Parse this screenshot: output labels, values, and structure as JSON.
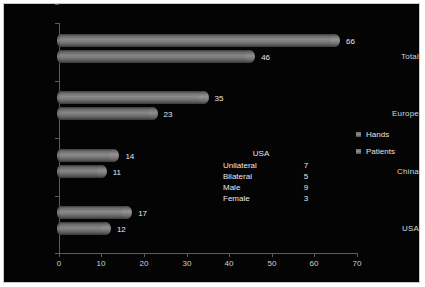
{
  "chart_data": {
    "type": "bar",
    "orientation": "horizontal",
    "title": "",
    "xlabel": "",
    "ylabel": "",
    "categories": [
      "Total",
      "Europe",
      "China",
      "USA"
    ],
    "series": [
      {
        "name": "Hands",
        "values": [
          66,
          35,
          14,
          17
        ]
      },
      {
        "name": "Patients",
        "values": [
          46,
          23,
          11,
          12
        ]
      }
    ],
    "xlim": [
      0,
      70
    ],
    "xticks": [
      0,
      10,
      20,
      30,
      40,
      50,
      60,
      70
    ],
    "grid": false,
    "legend_position": "right"
  },
  "legend": {
    "items": [
      {
        "label": "Hands",
        "marker": "square-swatch"
      },
      {
        "label": "Patients",
        "marker": "square-swatch"
      }
    ]
  },
  "inset_table": {
    "title": "USA",
    "rows": [
      {
        "key": "Unilateral",
        "value": "7"
      },
      {
        "key": "Bilateral",
        "value": "5"
      },
      {
        "key": "Male",
        "value": "9"
      },
      {
        "key": "Female",
        "value": "3"
      }
    ]
  },
  "colors": {
    "background": "#040404",
    "frame_border": "#c9c9c4",
    "axis": "#5c5c5c",
    "text": "#e0e0e0",
    "bar_hands": "#8a8a8a",
    "bar_patients": "#858585"
  }
}
